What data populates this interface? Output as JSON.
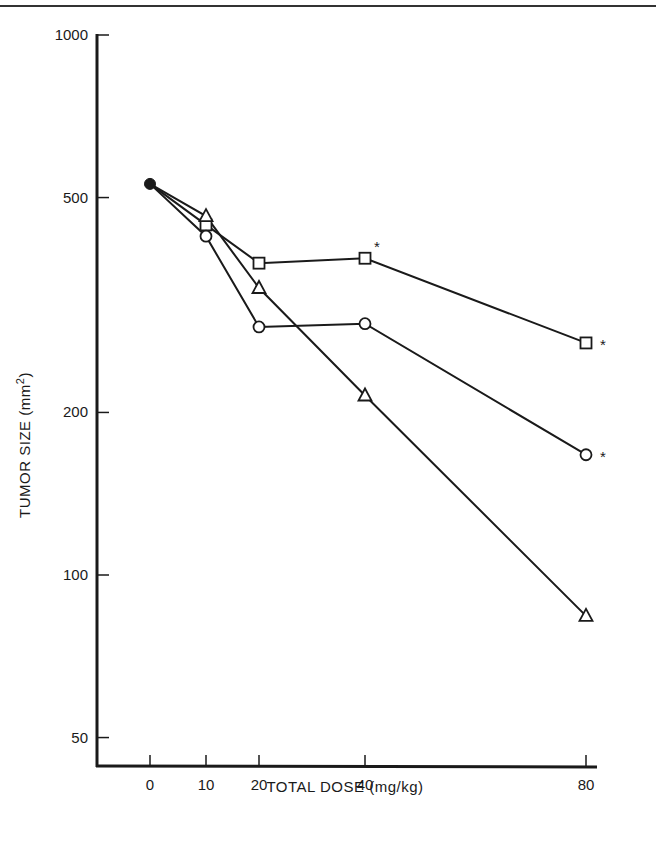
{
  "chart_data": {
    "type": "line",
    "title": "",
    "xlabel": "TOTAL DOSE (mg/kg)",
    "ylabel": "TUMOR SIZE (mm²)",
    "ylabel_main": "TUMOR SIZE (mm",
    "ylabel_sup": "2",
    "ylabel_close": ")",
    "yscale": "log",
    "ylim": [
      45,
      1000
    ],
    "xlim": [
      -10,
      90
    ],
    "grid": false,
    "legend": "none",
    "x_ticks": [
      0,
      10,
      20,
      40,
      80
    ],
    "x_tick_labels": [
      "0",
      "10",
      "20",
      "40",
      "80"
    ],
    "y_ticks": [
      1000,
      500,
      200,
      100,
      50
    ],
    "y_tick_labels": [
      "1000",
      "500",
      "200",
      "100",
      "50"
    ],
    "x": [
      0,
      10,
      20,
      40,
      80
    ],
    "series": [
      {
        "name": "square",
        "marker": "open-square",
        "values": [
          530,
          445,
          378,
          386,
          269
        ],
        "significant": [
          false,
          false,
          false,
          true,
          true
        ]
      },
      {
        "name": "circle",
        "marker": "open-circle",
        "values": [
          530,
          424,
          288,
          292,
          167
        ],
        "significant": [
          false,
          false,
          false,
          false,
          true
        ]
      },
      {
        "name": "triangle",
        "marker": "open-triangle",
        "values": [
          530,
          462,
          340,
          215,
          84
        ],
        "significant": [
          false,
          false,
          false,
          false,
          false
        ]
      }
    ],
    "baseline_point": {
      "x": 0,
      "value": 530,
      "marker": "filled-circle"
    },
    "annotations": [
      {
        "text": "*",
        "series": "square",
        "x": 40
      },
      {
        "text": "*",
        "series": "square",
        "x": 80
      },
      {
        "text": "*",
        "series": "circle",
        "x": 80
      }
    ]
  },
  "colors": {
    "ink": "#1a1a1a",
    "background": "#ffffff"
  }
}
